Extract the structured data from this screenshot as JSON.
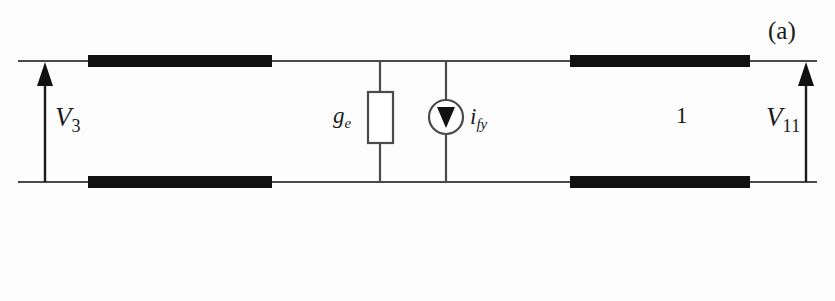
{
  "figure": {
    "caption": "(a)",
    "type": "two-port-equivalent-circuit",
    "background_color": "#fdfdfd",
    "ink_color": "#1a1a1a"
  },
  "labels": {
    "left_port_voltage": {
      "symbol": "V",
      "subscript": "3",
      "text": "V3"
    },
    "right_port_voltage": {
      "symbol": "V",
      "subscript": "11",
      "text": "V11"
    },
    "conductance": {
      "symbol": "g",
      "subscript": "e",
      "text": "ge"
    },
    "current_source": {
      "symbol": "i",
      "subscript": "fy",
      "text": "ify"
    },
    "branch_number": "1"
  },
  "components": [
    {
      "name": "left-port-voltage-arrow",
      "kind": "voltage-arrow",
      "direction": "up",
      "label": "V3"
    },
    {
      "name": "left-top-conductor-bar",
      "kind": "thick-conductor",
      "rail": "top",
      "x_start": 88,
      "x_end": 272
    },
    {
      "name": "left-bottom-conductor-bar",
      "kind": "thick-conductor",
      "rail": "bottom",
      "x_start": 88,
      "x_end": 272
    },
    {
      "name": "conductance-resistor",
      "kind": "resistor-box",
      "label": "ge",
      "x": 380
    },
    {
      "name": "current-source",
      "kind": "circular-current-source",
      "arrow_direction": "down",
      "label": "ify",
      "x": 446
    },
    {
      "name": "right-top-conductor-bar",
      "kind": "thick-conductor",
      "rail": "top",
      "x_start": 570,
      "x_end": 750
    },
    {
      "name": "right-bottom-conductor-bar",
      "kind": "thick-conductor",
      "rail": "bottom",
      "x_start": 570,
      "x_end": 750
    },
    {
      "name": "right-port-voltage-arrow",
      "kind": "voltage-arrow",
      "direction": "up",
      "label": "V11"
    }
  ]
}
